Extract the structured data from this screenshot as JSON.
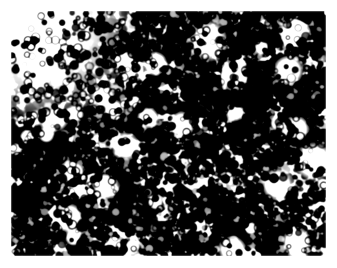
{
  "page": {
    "width": 337,
    "height": 268,
    "background_color": "#ffffff",
    "kind": "micrograph",
    "alt_text": "High-contrast black and white histological micrograph of densely packed small round nuclei"
  },
  "micrograph": {
    "name": "histology-micrograph",
    "frame": {
      "x": 11,
      "y": 11,
      "width": 315,
      "height": 245,
      "margin_color": "#ffffff",
      "has_border": false
    },
    "appearance": {
      "background_color": "#f7f7f5",
      "highlight_color": "#ffffff",
      "midtone_color": "#9a9a98",
      "nucleus_color": "#141414",
      "deep_shadow_color": "#000000",
      "contrast": "very-high",
      "tone": "grayscale",
      "grain_amount": 0.16,
      "blur_radius_px": 0.7
    },
    "texture": {
      "description": "densely packed dark round nuclei on pale cytoplasmic background",
      "nucleus_count": 4200,
      "nucleus_radius_min_px": 1.6,
      "nucleus_radius_max_px": 4.4,
      "nucleus_mean_radius_px": 2.8,
      "clump_count": 160,
      "clump_radius_min_px": 9,
      "clump_radius_max_px": 30,
      "pale_void_count": 52,
      "pale_void_radius_min_px": 7,
      "pale_void_radius_max_px": 26,
      "overall_dark_fraction": 0.52,
      "random_seed": 20240517
    },
    "density_field": {
      "description": "relative nuclear density by image region, 0 = pale/empty, 1 = solid dark",
      "grid_cols": 5,
      "grid_rows": 4,
      "values": [
        [
          0.12,
          0.58,
          0.72,
          0.66,
          0.7
        ],
        [
          0.48,
          0.62,
          0.55,
          0.74,
          0.78
        ],
        [
          0.6,
          0.5,
          0.42,
          0.56,
          0.52
        ],
        [
          0.64,
          0.7,
          0.62,
          0.58,
          0.66
        ]
      ]
    }
  },
  "chart_data": {
    "type": "heatmap",
    "title": "",
    "xlabel": "",
    "ylabel": "",
    "categories_x": [
      "col-1",
      "col-2",
      "col-3",
      "col-4",
      "col-5"
    ],
    "categories_y": [
      "row-1",
      "row-2",
      "row-3",
      "row-4"
    ],
    "values": [
      [
        0.12,
        0.58,
        0.72,
        0.66,
        0.7
      ],
      [
        0.48,
        0.62,
        0.55,
        0.74,
        0.78
      ],
      [
        0.6,
        0.5,
        0.42,
        0.56,
        0.52
      ],
      [
        0.64,
        0.7,
        0.62,
        0.58,
        0.66
      ]
    ],
    "zlim": [
      0,
      1
    ],
    "colorbar": false,
    "legend": false,
    "grid": false,
    "annotations": []
  }
}
